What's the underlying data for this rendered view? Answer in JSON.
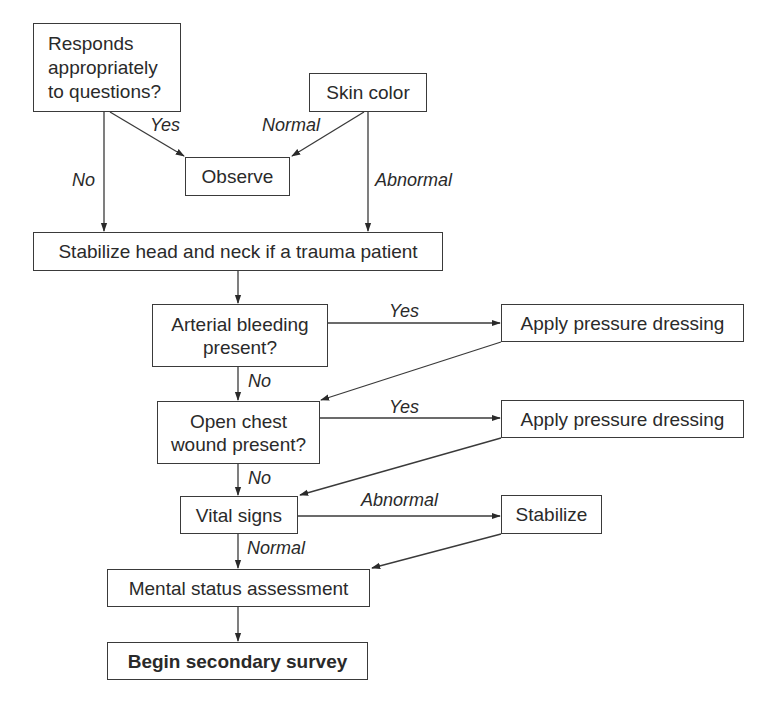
{
  "nodes": {
    "responds": "Responds appropriately to questions?",
    "responds_lines": [
      "Responds",
      "appropriately",
      "to questions?"
    ],
    "skin_color": "Skin color",
    "observe": "Observe",
    "stabilize_head": "Stabilize head and neck if a trauma patient",
    "arterial_lines": [
      "Arterial bleeding",
      "present?"
    ],
    "apply_pressure_1": "Apply pressure dressing",
    "open_chest_lines": [
      "Open chest",
      "wound present?"
    ],
    "apply_pressure_2": "Apply pressure dressing",
    "vital_signs": "Vital signs",
    "stabilize": "Stabilize",
    "mental_status": "Mental status assessment",
    "begin_secondary": "Begin secondary survey"
  },
  "edge_labels": {
    "responds_yes": "Yes",
    "responds_no": "No",
    "skin_normal": "Normal",
    "skin_abnormal": "Abnormal",
    "arterial_yes": "Yes",
    "arterial_no": "No",
    "chest_yes": "Yes",
    "chest_no": "No",
    "vital_abnormal": "Abnormal",
    "vital_normal": "Normal"
  },
  "colors": {
    "line": "#3a3a3a",
    "text": "#2a2a2a",
    "background": "#ffffff"
  }
}
